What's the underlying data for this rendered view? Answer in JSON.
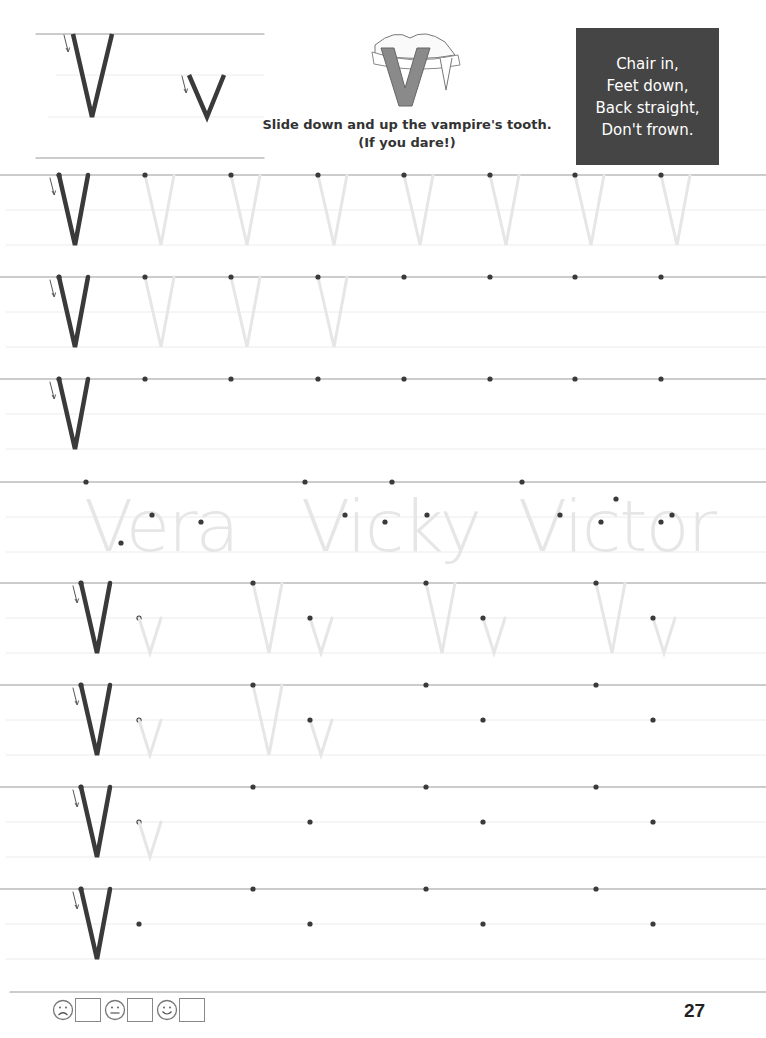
{
  "header": {
    "model_letters": {
      "upper": "V",
      "lower": "v"
    },
    "instruction_line1": "Slide down and up the vampire's tooth.",
    "instruction_line2": "(If you dare!)",
    "illustration": "vampire-tooth-V"
  },
  "rhyme": {
    "lines": [
      "Chair in,",
      "Feet down,",
      "Back straight,",
      "Don't frown."
    ],
    "bg_color": "#454545"
  },
  "practice_rows": [
    {
      "type": "upper",
      "top": 175,
      "traced": 7,
      "dots": [
        145,
        231,
        318,
        404,
        490,
        575,
        661
      ]
    },
    {
      "type": "upper",
      "top": 277,
      "traced": 3,
      "dots": [
        145,
        231,
        318,
        404,
        490,
        575,
        661
      ]
    },
    {
      "type": "upper",
      "top": 379,
      "traced": 0,
      "dots": [
        145,
        231,
        318,
        404,
        490,
        575,
        661
      ]
    },
    {
      "type": "names",
      "top": 482,
      "names": [
        "Vera",
        "Vicky",
        "Victor"
      ]
    },
    {
      "type": "pair",
      "top": 583,
      "traced_pairs": 4,
      "pairs": [
        253,
        426,
        596
      ]
    },
    {
      "type": "pair",
      "top": 685,
      "traced_pairs": 2,
      "pairs": [
        253,
        426,
        596
      ]
    },
    {
      "type": "pair",
      "top": 787,
      "traced_pairs": 1,
      "pairs": [
        253,
        426,
        596
      ]
    },
    {
      "type": "pair",
      "top": 889,
      "traced_pairs": 0,
      "pairs": [
        253,
        426,
        596
      ]
    }
  ],
  "footer": {
    "self_rating": [
      {
        "face": "sad",
        "label": "sad-face"
      },
      {
        "face": "neutral",
        "label": "neutral-face"
      },
      {
        "face": "happy",
        "label": "happy-face"
      }
    ],
    "page_number": "27"
  },
  "colors": {
    "ink": "#3a3a3a",
    "trace": "#e6e6e6",
    "rule": "#9a9a9a",
    "midline": "#ececec"
  }
}
